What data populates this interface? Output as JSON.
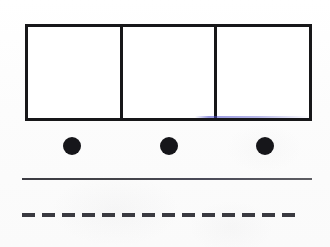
{
  "figure": {
    "canvas": {
      "width": 330,
      "height": 247
    },
    "background_color": "#fdfdfd",
    "ink_color": "#171719"
  },
  "boxes": {
    "name": "box-row",
    "count": 3,
    "stroke_color": "#171719",
    "stroke_width_px": 3,
    "fill_color": "#ffffff",
    "bounds": {
      "x": 25,
      "y": 24,
      "width": 287,
      "height": 97
    },
    "divider_x_positions": [
      119,
      216
    ],
    "cells": [
      {
        "label": "",
        "index": 1
      },
      {
        "label": "",
        "index": 2
      },
      {
        "label": "",
        "index": 3
      }
    ]
  },
  "dots": {
    "name": "dot-row",
    "count": 3,
    "color": "#16161a",
    "diameter_px": 18,
    "center_y": 146,
    "center_x_positions": [
      72,
      169,
      265
    ]
  },
  "solid_rule": {
    "name": "solid-horizontal-line",
    "color": "#44444a",
    "thickness_px": 2,
    "x_start": 22,
    "x_end": 312,
    "y": 180
  },
  "dashed_rule": {
    "name": "dashed-horizontal-line",
    "color": "#3a3a40",
    "thickness_px": 4,
    "x_start": 22,
    "x_end": 312,
    "y": 215,
    "dash_length_px": 13,
    "gap_length_px": 7,
    "dash_count": 14
  },
  "artifacts": {
    "scan_fringe": {
      "name": "chromatic-scan-fringe",
      "color": "#4646c8",
      "location": "bottom edge of third box cell"
    }
  }
}
